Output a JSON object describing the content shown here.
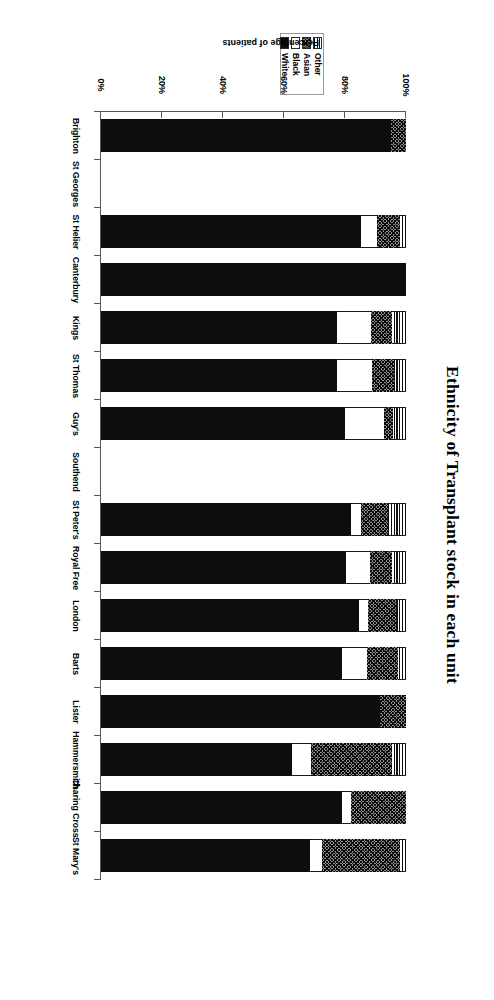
{
  "chart_data": {
    "type": "bar",
    "subtype": "stacked-horizontal-100pct",
    "title": "Ethnicity of Transplant stock in each unit",
    "xlabel": "Percentage of patients",
    "ylabel": "",
    "xlim": [
      0,
      100
    ],
    "xticks": [
      "0%",
      "20%",
      "40%",
      "60%",
      "80%",
      "100%"
    ],
    "xtick_values": [
      0,
      20,
      40,
      60,
      80,
      100
    ],
    "grid": false,
    "legend_position": "top-center",
    "orientation": "rotated-180",
    "categories": [
      "St Mary's",
      "Charing Cross",
      "Hammersmith",
      "Lister",
      "Barts",
      "London",
      "Royal Free",
      "St Peter's",
      "Southend",
      "Guy's",
      "St Thomas",
      "Kings",
      "Canterbury",
      "St Helier",
      "St Georges",
      "Brighton"
    ],
    "series": [
      {
        "name": "White",
        "fill": "solid-black",
        "color": "#0d0d0d",
        "values": [
          68.5,
          79.0,
          62.6,
          91.5,
          79.0,
          84.5,
          80.3,
          82.0,
          0,
          79.9,
          77.3,
          77.3,
          100.0,
          85.3,
          0,
          95.1
        ]
      },
      {
        "name": "Black",
        "fill": "empty-white",
        "color": "#ffffff",
        "values": [
          3.9,
          3.0,
          6.2,
          0,
          8.2,
          3.0,
          7.9,
          3.3,
          0,
          12.8,
          11.5,
          11.2,
          0,
          5.2,
          0,
          0
        ]
      },
      {
        "name": "Asian",
        "fill": "cross-hatch",
        "color": "#8d8d8d",
        "values": [
          25.6,
          18.0,
          26.6,
          8.5,
          10.2,
          9.2,
          7.2,
          8.9,
          0,
          3.0,
          7.2,
          6.9,
          0,
          7.5,
          0,
          4.9
        ]
      },
      {
        "name": "Other",
        "fill": "vertical-stripes",
        "color": "#ffffff",
        "values": [
          2.0,
          0,
          4.6,
          0,
          2.6,
          3.3,
          4.6,
          5.8,
          0,
          4.3,
          4.0,
          4.6,
          0,
          2.0,
          0,
          0
        ]
      }
    ],
    "empty_categories": [
      "Southend",
      "St Georges"
    ]
  },
  "legend": {
    "entries": [
      {
        "label": "Other",
        "swatch": "vertical-stripes-swatch"
      },
      {
        "label": "Asian",
        "swatch": "cross-hatch-swatch"
      },
      {
        "label": "Black",
        "swatch": "empty-white-swatch"
      },
      {
        "label": "White",
        "swatch": "solid-black-swatch"
      }
    ]
  }
}
